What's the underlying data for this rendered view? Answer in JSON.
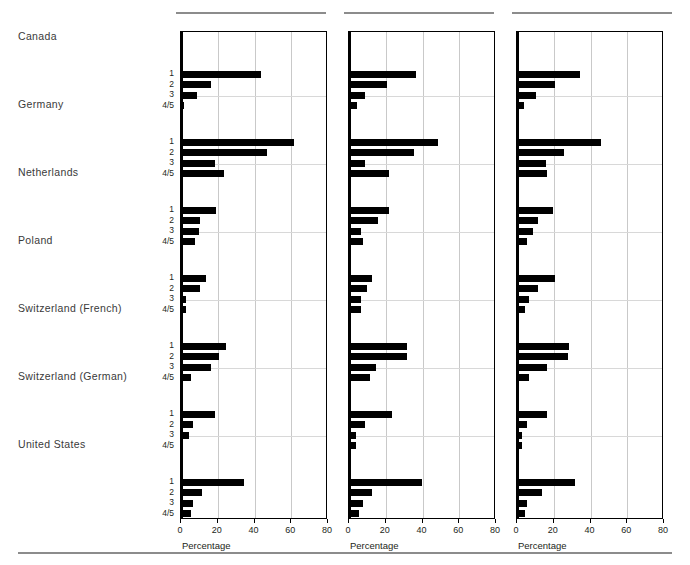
{
  "figure": {
    "panel_count": 3,
    "axis_title": "Percentage",
    "xlim": [
      0,
      80
    ],
    "xticks": [
      0,
      20,
      40,
      60,
      80
    ],
    "xtick_labels": [
      "0",
      "20",
      "40",
      "60",
      "80"
    ],
    "category_labels": [
      "1",
      "2",
      "3",
      "4/5"
    ],
    "countries": [
      "Canada",
      "Germany",
      "Netherlands",
      "Poland",
      "Switzerland (French)",
      "Switzerland (German)",
      "United States"
    ]
  },
  "chart_data": {
    "type": "bar",
    "title": "",
    "xlabel": "Percentage",
    "ylabel": "",
    "xlim": [
      0,
      80
    ],
    "xticks": [
      0,
      20,
      40,
      60,
      80
    ],
    "grid": "vertical gridlines at 20, 40, 60; horizontal separators between country blocks",
    "orientation": "horizontal",
    "legend": "none",
    "groups": [
      "1",
      "2",
      "3",
      "4/5"
    ],
    "categories": [
      "Canada",
      "Germany",
      "Netherlands",
      "Poland",
      "Switzerland (French)",
      "Switzerland (German)",
      "United States"
    ],
    "panels": [
      {
        "index": 1,
        "xlabel": "Percentage",
        "values": {
          "Canada": [
            43.0,
            16.0,
            8.0,
            1.0
          ],
          "Germany": [
            61.0,
            46.0,
            18.0,
            23.0
          ],
          "Netherlands": [
            18.5,
            10.0,
            9.0,
            7.0
          ],
          "Poland": [
            13.0,
            10.0,
            2.0,
            2.0
          ],
          "Switzerland (French)": [
            24.0,
            20.0,
            16.0,
            5.0
          ],
          "Switzerland (German)": [
            18.0,
            6.0,
            4.0,
            0.5
          ],
          "United States": [
            34.0,
            11.0,
            6.0,
            5.0
          ]
        }
      },
      {
        "index": 2,
        "xlabel": "Percentage",
        "values": {
          "Canada": [
            36.0,
            20.0,
            8.0,
            4.0
          ],
          "Germany": [
            48.0,
            35.0,
            8.0,
            21.0
          ],
          "Netherlands": [
            21.0,
            15.0,
            6.0,
            7.0
          ],
          "Poland": [
            12.0,
            9.0,
            6.0,
            6.0
          ],
          "Switzerland (French)": [
            31.0,
            31.0,
            14.0,
            11.0
          ],
          "Switzerland (German)": [
            23.0,
            8.0,
            3.0,
            3.0
          ],
          "United States": [
            39.0,
            12.0,
            7.0,
            5.0
          ]
        }
      },
      {
        "index": 3,
        "xlabel": "Percentage",
        "values": {
          "Canada": [
            34.0,
            20.0,
            10.0,
            3.0
          ],
          "Germany": [
            45.0,
            25.0,
            15.0,
            16.0
          ],
          "Netherlands": [
            19.0,
            11.0,
            8.0,
            5.0
          ],
          "Poland": [
            20.0,
            11.0,
            6.0,
            4.0
          ],
          "Switzerland (French)": [
            28.0,
            27.0,
            16.0,
            6.0
          ],
          "Switzerland (German)": [
            16.0,
            5.0,
            2.0,
            2.0
          ],
          "United States": [
            31.0,
            13.0,
            5.0,
            4.0
          ]
        }
      }
    ]
  }
}
